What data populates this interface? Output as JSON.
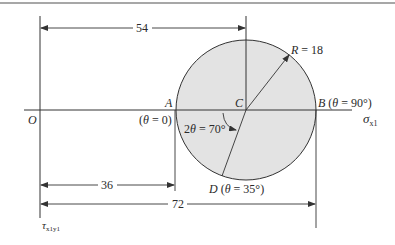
{
  "diagram": {
    "colors": {
      "circle_fill": "#e3e3e3",
      "stroke": "#333333",
      "border": "#8a8a8a"
    },
    "points": {
      "origin": "O",
      "center": "C",
      "A_label": "A",
      "A_note": "(θ = 0)",
      "B_label": "B (θ = 90°)",
      "D_label": "D (θ = 35°)"
    },
    "radius_label": "R = 18",
    "angle_label": "2θ = 70°",
    "axes": {
      "x_label": "σ",
      "x_sub": "x1",
      "y_label": "τ",
      "y_sub": "x1y1"
    },
    "dimensions": {
      "center_distance": "54",
      "A_distance": "36",
      "B_distance": "72"
    }
  }
}
